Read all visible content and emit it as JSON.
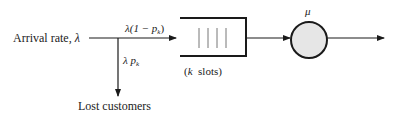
{
  "diagram": {
    "type": "queueing-system",
    "labels": {
      "arrival": "Arrival rate, ",
      "arrival_symbol": "λ",
      "admitted_flow_prefix": "λ(1 − ",
      "admitted_flow_p": "p",
      "admitted_flow_sub": "k",
      "admitted_flow_suffix": ")",
      "lost_flow_lambda": "λ ",
      "lost_flow_p": "p",
      "lost_flow_sub": "k",
      "queue_caption_open": "(",
      "queue_caption_k": "k",
      "queue_caption_rest": "  slots)",
      "service_rate": "μ",
      "lost_customers": "Lost customers"
    },
    "queue": {
      "slot_count": 4
    },
    "colors": {
      "stroke": "#1a1a1a",
      "server_fill": "#e6e6e6",
      "slot_lines": "#777777"
    }
  }
}
